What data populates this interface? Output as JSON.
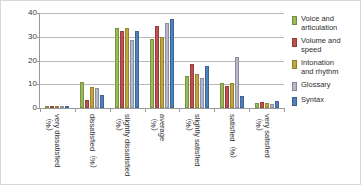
{
  "chart_data": {
    "type": "bar",
    "title": "",
    "xlabel": "",
    "ylabel": "",
    "ylim": [
      0,
      40
    ],
    "yticks": [
      0,
      10,
      20,
      30,
      40
    ],
    "grid": true,
    "legend_position": "right",
    "categories": [
      "very dissatisfied\n（%）",
      "dissatisfied（%）",
      "slightly dissatisfied\n（%）",
      "average\n（%）",
      "slightly satisfied\n（%）",
      "satisfied（%）",
      "very satisfied\n（%）"
    ],
    "series": [
      {
        "name": "Voice and\narticulation",
        "color": "#9BBB59",
        "values": [
          0.4,
          11.0,
          33.8,
          29.0,
          13.3,
          10.4,
          2.3
        ]
      },
      {
        "name": "Volume and\nspeed",
        "color": "#C0504D",
        "values": [
          0.7,
          3.5,
          32.3,
          34.7,
          18.5,
          9.3,
          2.6
        ]
      },
      {
        "name": "Intonation\nand rhythm",
        "color": "#C2A73E",
        "values": [
          0.4,
          9.0,
          33.6,
          30.0,
          14.4,
          10.4,
          2.3
        ]
      },
      {
        "name": "Glossary",
        "color": "#B3B8CC",
        "values": [
          0.3,
          8.5,
          28.8,
          35.8,
          12.8,
          21.4,
          1.9
        ]
      },
      {
        "name": "Syntax",
        "color": "#4F81BD",
        "values": [
          0.3,
          5.5,
          32.5,
          37.6,
          17.7,
          4.9,
          3.0
        ]
      }
    ]
  }
}
